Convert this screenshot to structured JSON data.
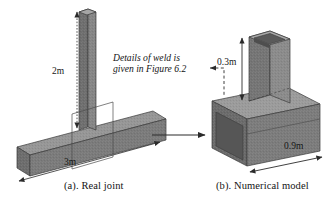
{
  "figure": {
    "kind": "engineering-diagram",
    "background_color": "#ffffff",
    "panels": [
      {
        "id": "real-joint",
        "caption": "(a). Real joint",
        "column_height_label": "2m",
        "beam_length_label": "3m",
        "has_detail_callout_box": true,
        "column_type": "solid square section",
        "beam_type": "solid rectangular section"
      },
      {
        "id": "numerical-model",
        "caption": "(b). Numerical model",
        "column_height_label": "0.3m",
        "beam_length_label": "0.9m",
        "column_type": "hollow box section",
        "beam_type": "hollow channel section"
      }
    ],
    "annotation": {
      "line1": "Details of weld is",
      "line2": "given in Figure 6.2",
      "style": "italic",
      "leader": "dashed elbow with arrowhead pointing left toward the text"
    },
    "transition_arrow": {
      "label": "",
      "from_panel": "real-joint",
      "to_panel": "numerical-model",
      "direction": "left-to-right"
    },
    "dimension_labels": [
      {
        "name": "column-height-real",
        "text": "2m"
      },
      {
        "name": "beam-length-real",
        "text": "3m"
      },
      {
        "name": "column-height-model",
        "text": "0.3m"
      },
      {
        "name": "beam-length-model",
        "text": "0.9m"
      }
    ],
    "colors": {
      "face_front": "#7d7d7d",
      "face_side": "#6a6a6a",
      "face_top": "#9a9a9a",
      "face_inner": "#5c5c5c",
      "outline": "#3a3a3a",
      "dimension_line": "#2b2b2b",
      "text": "#141414"
    }
  }
}
